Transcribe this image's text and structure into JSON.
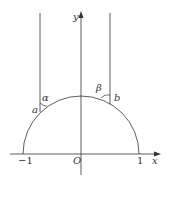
{
  "diagram": {
    "axes": {
      "x_label": "x",
      "y_label": "y",
      "origin_label": "O"
    },
    "ticks": {
      "neg_one": "−1",
      "pos_one": "1"
    },
    "points": {
      "a": "a",
      "b": "b"
    },
    "angles": {
      "alpha": "α",
      "beta": "β"
    },
    "colors": {
      "stroke": "#333333",
      "background": "#ffffff"
    }
  }
}
